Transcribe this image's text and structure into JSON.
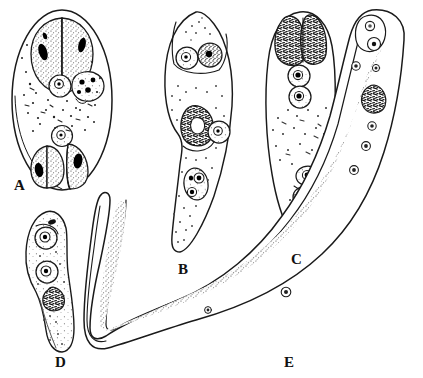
{
  "plate": {
    "title": "",
    "background_color": "#ffffff",
    "ink_color": "#1a1a1a",
    "stipple_color": "#4a4a4a",
    "nucleus_color": "#000000",
    "width": 423,
    "height": 378
  },
  "figures": [
    {
      "id": "A",
      "label": "A",
      "label_x": 14,
      "label_y": 178,
      "shape": "oval-cyst",
      "description": "Large oval cyst containing a pair of large stippled daughter cells with dark elongate nuclei at top, a small round cell between them, a granular multi-nucleate cell at upper right, scattered granules through the middle, and three stippled cells with dark nuclei at the bottom.",
      "outline": {
        "cx": 62,
        "cy": 100,
        "rx": 51,
        "ry": 91
      },
      "internal_bodies": 7
    },
    {
      "id": "B",
      "label": "B",
      "label_x": 178,
      "label_y": 262,
      "shape": "elongate-sporocyst",
      "description": "Elongate flask-shaped body with constricted waist; two round nucleated germinal cells in the broad upper end, a large irregular dark granular mass with an adjacent nucleated cell mid-body, and a binucleate cell in the narrow tail.",
      "internal_bodies": 5
    },
    {
      "id": "C",
      "label": "C",
      "label_x": 291,
      "label_y": 252,
      "shape": "elongate-sporocyst",
      "description": "Elongate club-shaped body with a large dark bilobed granular mass at the anterior end, two round nucleated cells beneath it, a clear stippled mid-region, and two nucleated cells near the posterior third.",
      "internal_bodies": 5
    },
    {
      "id": "D",
      "label": "D",
      "label_x": 55,
      "label_y": 355,
      "shape": "small-elongate-larva",
      "description": "Small sinuous elongate larva with stippled cytoplasm, two round nucleated cells in the anterior half and a dark granular mass at the mid-body constriction.",
      "internal_bodies": 3
    },
    {
      "id": "E",
      "label": "E",
      "label_x": 284,
      "label_y": 355,
      "shape": "long-curved-worm",
      "description": "Very long, slender, U-shaped worm forming a deep curve; an anterior sucker-like head region with two small nucleated structures at upper right, a dark granular mass in the anterior third, and small scattered nuclei along the stippled body core that runs the full length.",
      "internal_bodies": 8
    }
  ],
  "labels": {
    "a": "A",
    "b": "B",
    "c": "C",
    "d": "D",
    "e": "E"
  }
}
